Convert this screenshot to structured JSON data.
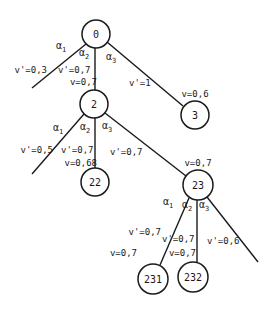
{
  "diagram": {
    "type": "game-tree",
    "nodes": [
      {
        "id": "0",
        "label": "0",
        "cx": 96,
        "cy": 34,
        "r": 14,
        "value": null
      },
      {
        "id": "2",
        "label": "2",
        "cx": 94,
        "cy": 104,
        "r": 14,
        "value": "v=0,7"
      },
      {
        "id": "3",
        "label": "3",
        "cx": 195,
        "cy": 115,
        "r": 14,
        "value": "v=0,6"
      },
      {
        "id": "22",
        "label": "22",
        "cx": 95,
        "cy": 182,
        "r": 14,
        "value": "v=0,68"
      },
      {
        "id": "23",
        "label": "23",
        "cx": 198,
        "cy": 185,
        "r": 15,
        "value": "v=0,7"
      },
      {
        "id": "231",
        "label": "231",
        "cx": 153,
        "cy": 279,
        "r": 15,
        "value": "v=0,7"
      },
      {
        "id": "232",
        "label": "232",
        "cx": 193,
        "cy": 277,
        "r": 15,
        "value": "v=0,7"
      }
    ],
    "edges": [
      {
        "from": "0",
        "to": null,
        "action": "α",
        "action_sub": "1",
        "v_prime": "v'=0,3"
      },
      {
        "from": "0",
        "to": "2",
        "action": "α",
        "action_sub": "2",
        "v_prime": "v'=0,7"
      },
      {
        "from": "0",
        "to": "3",
        "action": "α",
        "action_sub": "3",
        "v_prime": "v'=1"
      },
      {
        "from": "2",
        "to": null,
        "action": "α",
        "action_sub": "1",
        "v_prime": "v'=0,5"
      },
      {
        "from": "2",
        "to": "22",
        "action": "α",
        "action_sub": "2",
        "v_prime": "v'=0,7"
      },
      {
        "from": "2",
        "to": "23",
        "action": "α",
        "action_sub": "3",
        "v_prime": "v'=0,7"
      },
      {
        "from": "23",
        "to": "231",
        "action": "α",
        "action_sub": "1",
        "v_prime": "v'=0,7"
      },
      {
        "from": "23",
        "to": "232",
        "action": "α",
        "action_sub": "2",
        "v_prime": "v'=0,7"
      },
      {
        "from": "23",
        "to": null,
        "action": "α",
        "action_sub": "3",
        "v_prime": "v'=0,6"
      }
    ]
  }
}
